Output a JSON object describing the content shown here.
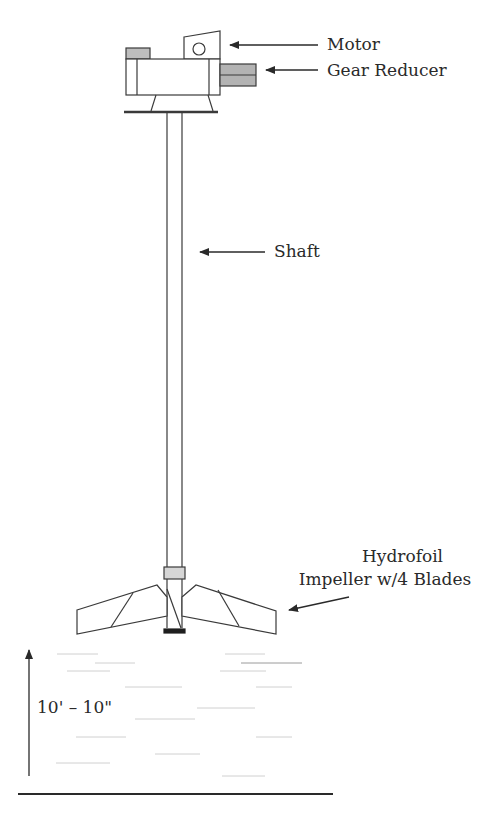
{
  "diagram": {
    "labels": {
      "motor": "Motor",
      "gear_reducer": "Gear Reducer",
      "shaft": "Shaft",
      "impeller_line1": "Hydrofoil",
      "impeller_line2": "Impeller w/4 Blades",
      "height_dimension": "10' – 10\""
    },
    "components": [
      "motor",
      "gear-reducer",
      "mounting-plate",
      "shaft",
      "hub-collar",
      "hydrofoil-impeller",
      "liquid-level",
      "tank-floor"
    ],
    "colors": {
      "line": "#3a3a3a",
      "fill_gray": "#b8b8b8",
      "fill_dark": "#222222",
      "text": "#2a2a2a",
      "liquid_lines": "#d4d4d4"
    }
  }
}
